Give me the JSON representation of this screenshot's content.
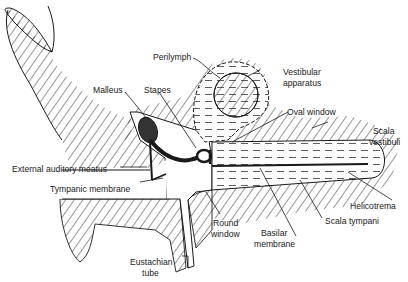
{
  "diagram": {
    "title": "",
    "style": {
      "ink": "#1a1a1a",
      "background": "#ffffff"
    },
    "labels": {
      "perilymph": "Perilymph",
      "vestibular_apparatus_1": "Vestibular",
      "vestibular_apparatus_2": "apparatus",
      "malleus": "Malleus",
      "stapes": "Stapes",
      "oval_window": "Oval window",
      "scala_vestibuli_1": "Scala",
      "scala_vestibuli_2": "vestibuli",
      "external_auditory_meatus": "External auditory meatus",
      "tympanic_membrane": "Tympanic membrane",
      "helicotrema": "Helicotrema",
      "round_window_1": "Round",
      "round_window_2": "window",
      "basilar_membrane_1": "Basilar",
      "basilar_membrane_2": "membrane",
      "scala_tympani": "Scala tympani",
      "eustachian_tube_1": "Eustachian",
      "eustachian_tube_2": "tube"
    }
  }
}
